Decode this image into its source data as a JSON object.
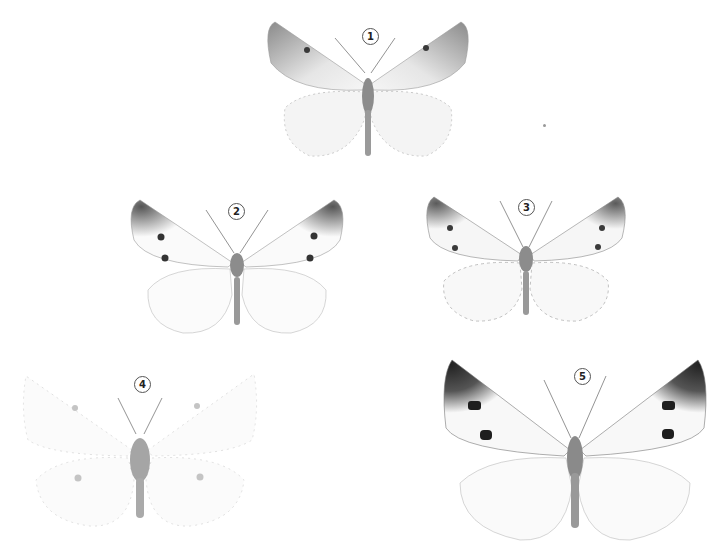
{
  "plate": {
    "background": "#ffffff",
    "specimens": [
      {
        "number": "1",
        "label": "1",
        "forewing_color": "#d6d6d6",
        "apex_color": "#8a8a8a",
        "spot_color": "#3a3a3a",
        "hindwing_color": "#f4f4f4",
        "spots": 1
      },
      {
        "number": "2",
        "label": "2",
        "forewing_color": "#fafafa",
        "apex_color": "#555555",
        "spot_color": "#333333",
        "hindwing_color": "#fbfbfb",
        "spots": 2
      },
      {
        "number": "3",
        "label": "3",
        "forewing_color": "#f6f6f6",
        "apex_color": "#5a5a5a",
        "spot_color": "#3a3a3a",
        "hindwing_color": "#f8f8f8",
        "spots": 2
      },
      {
        "number": "4",
        "label": "4",
        "forewing_color": "#fbfbfb",
        "apex_color": "#cfcfcf",
        "spot_color": "#b8b8b8",
        "hindwing_color": "#fbfbfb",
        "spots": 1
      },
      {
        "number": "5",
        "label": "5",
        "forewing_color": "#f8f8f8",
        "apex_color": "#222222",
        "spot_color": "#1e1e1e",
        "hindwing_color": "#fafafa",
        "spots": 2
      }
    ]
  }
}
